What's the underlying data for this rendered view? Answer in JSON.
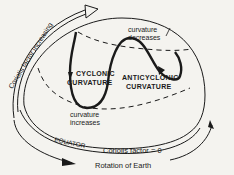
{
  "diagram": {
    "labels": {
      "coriolis_increasing": "Coriolis factor increasing",
      "cyclonic_1": "CYCLONIC",
      "cyclonic_2": "CURVATURE",
      "anticyclonic_1": "ANTICYCLONIC",
      "anticyclonic_2": "CURVATURE",
      "curv_decreases_1": "curvature",
      "curv_decreases_2": "decreases",
      "curv_increases_1": "curvature",
      "curv_increases_2": "increases",
      "equator": "EQUATOR",
      "coriolis_zero": "Coriolis factor = 0",
      "rotation": "Rotation of Earth"
    },
    "colors": {
      "ink": "#1a1a1a",
      "background": "#f4f3ef"
    }
  }
}
